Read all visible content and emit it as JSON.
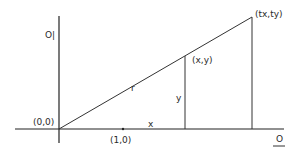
{
  "diagram": {
    "labels": {
      "vertical_axis": "O|",
      "origin": "(0,0)",
      "unit_point": "(1,0)",
      "point": "(x,y)",
      "scaled_point": "(tx,ty)",
      "radius": "r",
      "x_leg": "x",
      "y_leg": "y",
      "horizontal_axis": "O"
    },
    "colors": {
      "line": "#333333",
      "text": "#2a2a2a",
      "background": "#ffffff"
    }
  }
}
